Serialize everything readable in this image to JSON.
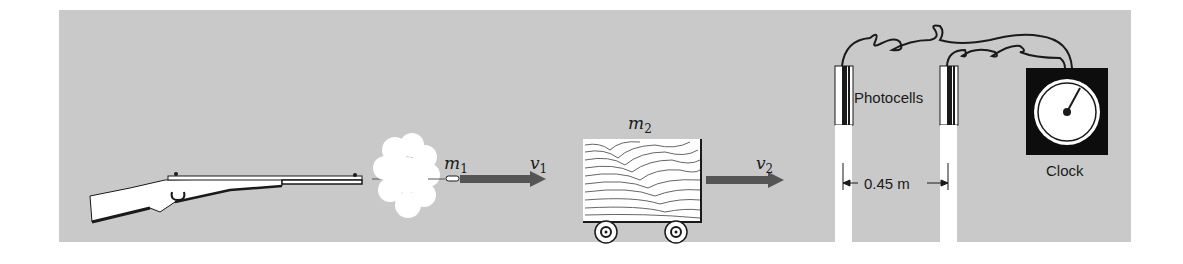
{
  "diagram": {
    "colors": {
      "background_panel": "#c9c9c9",
      "arrow": "#555555",
      "outline": "#1a1a1a",
      "white": "#ffffff"
    },
    "labels": {
      "bullet_mass": {
        "symbol": "m",
        "sub": "1"
      },
      "bullet_velocity": {
        "symbol": "v",
        "sub": "1"
      },
      "block_mass": {
        "symbol": "m",
        "sub": "2"
      },
      "block_velocity": {
        "symbol": "v",
        "sub": "2"
      },
      "photocells": "Photocells",
      "distance": "0.45 m",
      "clock": "Clock"
    },
    "components": [
      "rifle",
      "smoke-cloud",
      "bullet",
      "velocity-arrow-1",
      "wooden-block-on-cart",
      "velocity-arrow-2",
      "photocell-left",
      "photocell-right",
      "wires",
      "clock"
    ]
  }
}
